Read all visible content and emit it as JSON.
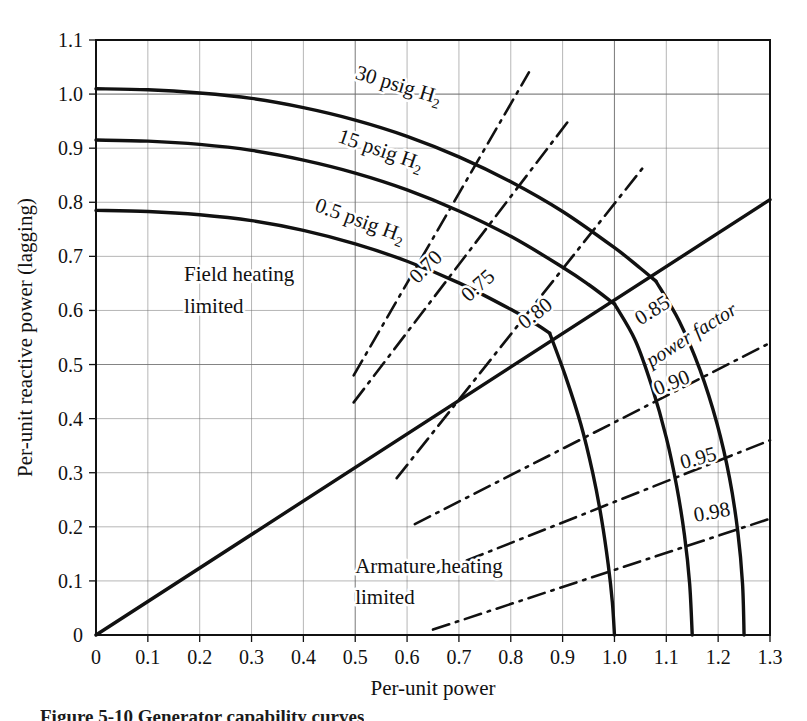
{
  "figure": {
    "type": "capability-curve-chart",
    "caption": "Figure 5-10 Generator capability curves"
  },
  "axes": {
    "x_title": "Per-unit power",
    "y_title": "Per-unit reactive power (lagging)",
    "x_ticks": [
      "0",
      "0.1",
      "0.2",
      "0.3",
      "0.4",
      "0.5",
      "0.6",
      "0.7",
      "0.8",
      "0.9",
      "1.0",
      "1.1",
      "1.2",
      "1.3"
    ],
    "y_ticks": [
      "0",
      "0.1",
      "0.2",
      "0.3",
      "0.4",
      "0.5",
      "0.6",
      "0.7",
      "0.8",
      "0.9",
      "1.0",
      "1.1"
    ],
    "x_min": 0,
    "x_max": 1.3,
    "x_step": 0.1,
    "y_min": 0,
    "y_max": 1.1,
    "y_step": 0.1,
    "grid": true
  },
  "annotations": {
    "field_heating_line1": "Field heating",
    "field_heating_line2": "limited",
    "armature_heating_line1": "Armature heating",
    "armature_heating_line2": "limited",
    "power_factor_legend": "power factor"
  },
  "colors": {
    "ink": "#111111",
    "grid": "#6f6f6f",
    "background": "#ffffff"
  },
  "chart_data": {
    "type": "line",
    "title": "Generator capability curves",
    "xlabel": "Per-unit power",
    "ylabel": "Per-unit reactive power (lagging)",
    "xlim": [
      0,
      1.3
    ],
    "ylim": [
      0,
      1.1
    ],
    "grid": true,
    "legend": "none",
    "series": [
      {
        "name": "30 psig H2",
        "style": "solid-thick",
        "role": "field-heating-limit",
        "label": "30 psig H₂",
        "label_at": [
          0.58,
          1.005
        ],
        "label_rotation": 17,
        "points": [
          [
            0.0,
            1.01
          ],
          [
            0.1,
            1.008
          ],
          [
            0.2,
            1.002
          ],
          [
            0.3,
            0.992
          ],
          [
            0.4,
            0.975
          ],
          [
            0.5,
            0.952
          ],
          [
            0.6,
            0.922
          ],
          [
            0.7,
            0.884
          ],
          [
            0.8,
            0.838
          ],
          [
            0.9,
            0.783
          ],
          [
            1.0,
            0.716
          ],
          [
            1.05,
            0.678
          ],
          [
            1.08,
            0.654
          ]
        ]
      },
      {
        "name": "15 psig H2",
        "style": "solid-thick",
        "role": "field-heating-limit",
        "label": "15 psig H₂",
        "label_at": [
          0.545,
          0.885
        ],
        "label_rotation": 19,
        "points": [
          [
            0.0,
            0.915
          ],
          [
            0.1,
            0.913
          ],
          [
            0.2,
            0.907
          ],
          [
            0.3,
            0.896
          ],
          [
            0.4,
            0.878
          ],
          [
            0.5,
            0.854
          ],
          [
            0.6,
            0.823
          ],
          [
            0.7,
            0.784
          ],
          [
            0.8,
            0.737
          ],
          [
            0.9,
            0.68
          ],
          [
            0.95,
            0.648
          ],
          [
            1.0,
            0.612
          ]
        ]
      },
      {
        "name": "0.5 psig H2",
        "style": "solid-thick",
        "role": "field-heating-limit",
        "label": "0.5 psig H₂",
        "label_at": [
          0.505,
          0.755
        ],
        "label_rotation": 20,
        "points": [
          [
            0.0,
            0.785
          ],
          [
            0.1,
            0.783
          ],
          [
            0.2,
            0.777
          ],
          [
            0.3,
            0.766
          ],
          [
            0.4,
            0.748
          ],
          [
            0.5,
            0.723
          ],
          [
            0.6,
            0.691
          ],
          [
            0.7,
            0.651
          ],
          [
            0.8,
            0.602
          ],
          [
            0.85,
            0.574
          ],
          [
            0.875,
            0.558
          ]
        ]
      },
      {
        "name": "Armature heating limit 0.5 psig",
        "style": "solid-thick",
        "role": "armature-heating-limit",
        "rating": 1.0,
        "points": [
          [
            0.875,
            0.558
          ],
          [
            0.905,
            0.48
          ],
          [
            0.935,
            0.39
          ],
          [
            0.958,
            0.3
          ],
          [
            0.975,
            0.215
          ],
          [
            0.988,
            0.13
          ],
          [
            0.996,
            0.06
          ],
          [
            1.0,
            0.0
          ]
        ]
      },
      {
        "name": "Armature heating limit 15 psig",
        "style": "solid-thick",
        "role": "armature-heating-limit",
        "rating": 1.15,
        "points": [
          [
            1.0,
            0.612
          ],
          [
            1.04,
            0.545
          ],
          [
            1.072,
            0.46
          ],
          [
            1.1,
            0.365
          ],
          [
            1.12,
            0.275
          ],
          [
            1.135,
            0.185
          ],
          [
            1.145,
            0.095
          ],
          [
            1.15,
            0.0
          ]
        ]
      },
      {
        "name": "Armature heating limit 30 psig",
        "style": "solid-thick",
        "role": "armature-heating-limit",
        "rating": 1.25,
        "points": [
          [
            1.08,
            0.654
          ],
          [
            1.125,
            0.58
          ],
          [
            1.165,
            0.49
          ],
          [
            1.198,
            0.39
          ],
          [
            1.222,
            0.29
          ],
          [
            1.238,
            0.19
          ],
          [
            1.247,
            0.095
          ],
          [
            1.25,
            0.0
          ]
        ]
      },
      {
        "name": "0.70 power factor",
        "style": "dash-dot",
        "role": "power-factor-line",
        "label": "0.70",
        "label_at": [
          0.645,
          0.672
        ],
        "label_rotation": -45,
        "points": [
          [
            0.497,
            0.48
          ],
          [
            0.835,
            1.04
          ]
        ]
      },
      {
        "name": "0.75 power factor",
        "style": "dash-dot",
        "role": "power-factor-line",
        "label": "0.75",
        "label_at": [
          0.745,
          0.637
        ],
        "label_rotation": -42,
        "points": [
          [
            0.497,
            0.43
          ],
          [
            0.915,
            0.955
          ]
        ]
      },
      {
        "name": "0.80 power factor",
        "style": "dash-dot",
        "role": "power-factor-line",
        "label": "0.80",
        "label_at": [
          0.855,
          0.585
        ],
        "label_rotation": -38,
        "points": [
          [
            0.58,
            0.29
          ],
          [
            1.06,
            0.87
          ]
        ]
      },
      {
        "name": "0.85 power factor",
        "style": "solid-thick",
        "role": "power-factor-line",
        "label": "0.85",
        "label_at": [
          1.08,
          0.59
        ],
        "label_rotation": -32,
        "points": [
          [
            0.0,
            0.0
          ],
          [
            1.3,
            0.805
          ]
        ]
      },
      {
        "name": "0.90 power factor",
        "style": "dash-dot",
        "role": "power-factor-line",
        "label": "0.90",
        "label_at": [
          1.115,
          0.455
        ],
        "label_rotation": -22,
        "points": [
          [
            0.615,
            0.205
          ],
          [
            1.3,
            0.54
          ]
        ]
      },
      {
        "name": "0.95 power factor",
        "style": "dash-dot",
        "role": "power-factor-line",
        "label": "0.95",
        "label_at": [
          1.165,
          0.315
        ],
        "label_rotation": -15,
        "points": [
          [
            0.655,
            0.115
          ],
          [
            1.3,
            0.36
          ]
        ]
      },
      {
        "name": "0.98 power factor",
        "style": "dash-dot",
        "role": "power-factor-line",
        "label": "0.98",
        "label_at": [
          1.19,
          0.215
        ],
        "label_rotation": -10,
        "points": [
          [
            0.65,
            0.01
          ],
          [
            1.3,
            0.215
          ]
        ]
      }
    ],
    "annotations": [
      {
        "text": "Field heating",
        "x": 0.17,
        "y": 0.655
      },
      {
        "text": "limited",
        "x": 0.17,
        "y": 0.595
      },
      {
        "text": "Armature heating",
        "x": 0.5,
        "y": 0.115
      },
      {
        "text": "limited",
        "x": 0.5,
        "y": 0.058
      },
      {
        "text": "power factor",
        "x": 1.155,
        "y": 0.545
      }
    ]
  }
}
